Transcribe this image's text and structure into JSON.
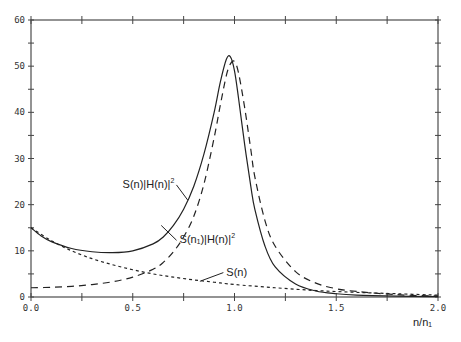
{
  "chart_data": {
    "type": "line",
    "title": "",
    "xlabel": "n/n₁",
    "ylabel": "",
    "xlim": [
      0.0,
      2.0
    ],
    "ylim": [
      0,
      60
    ],
    "grid": false,
    "legend": "inline annotations",
    "x_ticks": [
      "0.0",
      "0.5",
      "1.0",
      "1.5",
      "2.0"
    ],
    "x_minor_step": 0.25,
    "y_ticks": [
      "0",
      "10",
      "20",
      "30",
      "40",
      "50",
      "60"
    ],
    "y_minor_step": 5,
    "series": [
      {
        "name": "S(n)|H(n)|²",
        "style": "solid",
        "x": [
          0.0,
          0.05,
          0.1,
          0.2,
          0.3,
          0.4,
          0.5,
          0.6,
          0.65,
          0.7,
          0.75,
          0.8,
          0.85,
          0.9,
          0.93,
          0.96,
          0.98,
          1.0,
          1.02,
          1.05,
          1.08,
          1.1,
          1.15,
          1.2,
          1.3,
          1.4,
          1.5,
          1.6,
          1.8,
          2.0
        ],
        "values": [
          15.0,
          13.2,
          12.0,
          10.5,
          9.8,
          9.6,
          10.0,
          11.5,
          13.0,
          15.5,
          19.0,
          24.0,
          31.0,
          40.0,
          46.5,
          51.5,
          52.0,
          49.0,
          43.0,
          33.0,
          24.0,
          19.0,
          11.0,
          6.5,
          2.8,
          1.3,
          0.7,
          0.4,
          0.2,
          0.1
        ]
      },
      {
        "name": "S(n₁)|H(n)|²",
        "style": "long-dash",
        "x": [
          0.0,
          0.1,
          0.2,
          0.3,
          0.4,
          0.5,
          0.6,
          0.65,
          0.7,
          0.75,
          0.8,
          0.85,
          0.9,
          0.93,
          0.96,
          0.98,
          1.0,
          1.02,
          1.05,
          1.08,
          1.1,
          1.15,
          1.2,
          1.3,
          1.4,
          1.5,
          1.6,
          1.8,
          2.0
        ],
        "values": [
          2.0,
          2.1,
          2.3,
          2.7,
          3.3,
          4.3,
          6.0,
          7.5,
          9.8,
          13.0,
          17.5,
          24.5,
          34.5,
          41.5,
          48.0,
          50.5,
          51.0,
          48.5,
          41.0,
          32.0,
          26.0,
          16.5,
          11.0,
          5.5,
          3.0,
          1.8,
          1.2,
          0.5,
          0.2
        ]
      },
      {
        "name": "S(n)",
        "style": "short-dash",
        "x": [
          0.0,
          0.1,
          0.2,
          0.3,
          0.4,
          0.5,
          0.6,
          0.7,
          0.8,
          0.9,
          1.0,
          1.2,
          1.4,
          1.6,
          1.8,
          2.0
        ],
        "values": [
          15.0,
          12.2,
          10.0,
          8.3,
          7.0,
          5.9,
          5.0,
          4.3,
          3.7,
          3.2,
          2.7,
          2.0,
          1.4,
          1.0,
          0.7,
          0.4
        ]
      }
    ],
    "annotations": [
      {
        "text": "S(n)|H(n)|",
        "sup": "2",
        "x": 0.45,
        "y": 24.5,
        "leader_to": [
          0.77,
          21.0
        ]
      },
      {
        "text": "S(n₁)|H(n)|",
        "sup": "2",
        "x": 0.73,
        "y": 12.5,
        "leader_to": [
          0.64,
          15.5
        ]
      },
      {
        "text": "S(n)",
        "sup": "",
        "x": 0.96,
        "y": 5.5,
        "leader_to": [
          0.83,
          3.4
        ]
      }
    ]
  }
}
